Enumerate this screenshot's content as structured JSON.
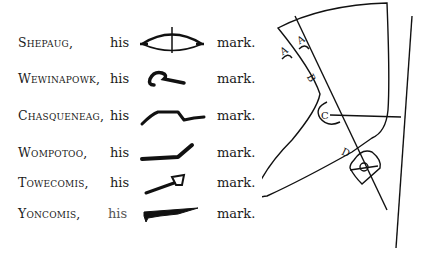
{
  "signatures": [
    {
      "name": "Shepaug,",
      "his": "his",
      "mark_word": "mark.",
      "mark_icon": "bow-and-arrow-icon"
    },
    {
      "name": "Wewinapowk,",
      "his": "his",
      "mark_word": "mark.",
      "mark_icon": "curl-hook-icon"
    },
    {
      "name": "Chasqueneag,",
      "his": "his",
      "mark_word": "mark.",
      "mark_icon": "zigzag-line-icon"
    },
    {
      "name": "Wompotoo,",
      "his": "his",
      "mark_word": "mark.",
      "mark_icon": "bent-line-icon"
    },
    {
      "name": "Towecomis,",
      "his": "his",
      "mark_word": "mark.",
      "mark_icon": "pipe-icon"
    },
    {
      "name": "Yoncomis,",
      "his": "his",
      "mark_word": "mark.",
      "mark_icon": "club-icon"
    }
  ],
  "diagram": {
    "labels": [
      "A",
      "A",
      "B",
      "C",
      "D"
    ]
  }
}
